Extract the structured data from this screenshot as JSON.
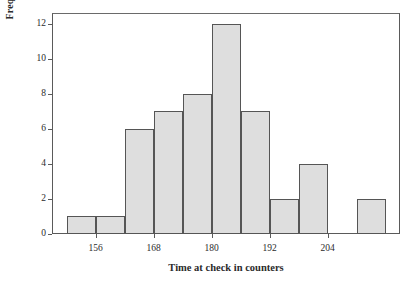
{
  "chart_data": {
    "type": "bar",
    "title": "",
    "subtitle": "",
    "xlabel": "Time at check in counters",
    "ylabel": "Frequency",
    "grid": false,
    "legend": false,
    "legend_position": "none",
    "bar_fill_color": "#dedede",
    "bar_edge_color": "#555555",
    "frame_color": "#5a5a5a",
    "text_color": "#2b2b2b",
    "background_color": "#ffffff",
    "xlim": [
      147,
      219
    ],
    "ylim": [
      0,
      12.6
    ],
    "bin_width": 6,
    "x_ticks": [
      156,
      168,
      180,
      192,
      204
    ],
    "x_tick_labels": [
      "156",
      "168",
      "180",
      "192",
      "204"
    ],
    "y_ticks": [
      0,
      2,
      4,
      6,
      8,
      10,
      12
    ],
    "y_tick_labels": [
      "0",
      "2",
      "4",
      "6",
      "8",
      "10",
      "12"
    ],
    "bins": [
      {
        "left": 150,
        "right": 156,
        "value": 1
      },
      {
        "left": 156,
        "right": 162,
        "value": 1
      },
      {
        "left": 162,
        "right": 168,
        "value": 6
      },
      {
        "left": 168,
        "right": 174,
        "value": 7
      },
      {
        "left": 174,
        "right": 180,
        "value": 8
      },
      {
        "left": 180,
        "right": 186,
        "value": 12
      },
      {
        "left": 186,
        "right": 192,
        "value": 7
      },
      {
        "left": 192,
        "right": 198,
        "value": 2
      },
      {
        "left": 198,
        "right": 204,
        "value": 4
      },
      {
        "left": 204,
        "right": 210,
        "value": 0
      },
      {
        "left": 210,
        "right": 216,
        "value": 2
      }
    ],
    "categories": [
      "150-156",
      "156-162",
      "162-168",
      "168-174",
      "174-180",
      "180-186",
      "186-192",
      "192-198",
      "198-204",
      "204-210",
      "210-216"
    ],
    "values": [
      1,
      1,
      6,
      7,
      8,
      12,
      7,
      2,
      4,
      0,
      2
    ],
    "total_count": 50
  }
}
